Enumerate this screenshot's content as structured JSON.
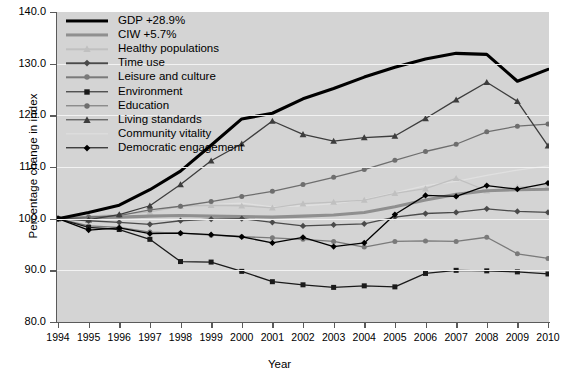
{
  "chart_data": {
    "type": "line",
    "title": "",
    "xlabel": "Year",
    "ylabel": "Percentage change in index",
    "x": [
      1994,
      1995,
      1996,
      1997,
      1998,
      1999,
      2000,
      2001,
      2002,
      2003,
      2004,
      2005,
      2006,
      2007,
      2008,
      2009,
      2010
    ],
    "xticklabels": [
      "1994",
      "1995",
      "1996",
      "1997",
      "1998",
      "1999",
      "2000",
      "2001",
      "2002",
      "2003",
      "2004",
      "2005",
      "2006",
      "2007",
      "2008",
      "2009",
      "2010"
    ],
    "ylim": [
      80.0,
      140.0
    ],
    "yticks": [
      80.0,
      90.0,
      100.0,
      110.0,
      120.0,
      130.0,
      140.0
    ],
    "yticklabels": [
      "80.0",
      "90.0",
      "100.0",
      "110.0",
      "120.0",
      "130.0",
      "140.0"
    ],
    "xlim": [
      1994,
      2010
    ],
    "grid": "horizontal",
    "legend_position": "upper-left",
    "plot_background": "#d4d4d4",
    "series": [
      {
        "name": "GDP +28.9%",
        "color": "#000000",
        "width": 3.1,
        "marker": "none",
        "values": [
          100.0,
          101.2,
          102.6,
          105.6,
          109.2,
          114.2,
          119.3,
          120.4,
          123.2,
          125.2,
          127.4,
          129.3,
          130.9,
          132.0,
          131.8,
          126.6,
          128.9
        ]
      },
      {
        "name": "CIW +5.7%",
        "color": "#8f8f8f",
        "width": 3.1,
        "marker": "none",
        "values": [
          100.0,
          100.2,
          100.3,
          100.5,
          100.6,
          100.5,
          100.4,
          100.3,
          100.5,
          100.7,
          101.2,
          102.3,
          103.6,
          104.7,
          105.4,
          105.6,
          105.7
        ]
      },
      {
        "name": "Healthy populations",
        "color": "#c0c0c0",
        "width": 1.3,
        "marker": "triangle",
        "values": [
          100.0,
          100.6,
          100.8,
          101.3,
          102.4,
          102.6,
          102.5,
          102.1,
          102.9,
          103.2,
          103.6,
          104.9,
          105.8,
          107.8,
          105.4,
          106.1,
          106.4
        ]
      },
      {
        "name": "Time use",
        "color": "#4a4a4a",
        "width": 1.3,
        "marker": "diamond",
        "values": [
          100.0,
          99.6,
          99.3,
          98.9,
          99.6,
          99.9,
          100.0,
          99.3,
          98.6,
          98.8,
          99.0,
          100.3,
          101.0,
          101.2,
          101.9,
          101.4,
          101.2
        ]
      },
      {
        "name": "Leisure and culture",
        "color": "#7a7a7a",
        "width": 1.3,
        "marker": "circle",
        "values": [
          100.0,
          98.6,
          98.3,
          97.4,
          97.2,
          96.8,
          96.5,
          96.3,
          96.0,
          95.6,
          94.5,
          95.6,
          95.7,
          95.6,
          96.4,
          93.2,
          92.3
        ]
      },
      {
        "name": "Environment",
        "color": "#1a1a1a",
        "width": 1.3,
        "marker": "square",
        "values": [
          100.0,
          98.3,
          97.9,
          96.0,
          91.7,
          91.6,
          89.8,
          87.8,
          87.2,
          86.7,
          87.0,
          86.8,
          89.4,
          90.0,
          89.9,
          89.7,
          89.3
        ]
      },
      {
        "name": "Education",
        "color": "#6e6e6e",
        "width": 1.3,
        "marker": "circle",
        "values": [
          100.0,
          100.3,
          100.6,
          101.7,
          102.4,
          103.3,
          104.3,
          105.3,
          106.6,
          108.0,
          109.5,
          111.3,
          113.0,
          114.4,
          116.8,
          117.9,
          118.3
        ]
      },
      {
        "name": "Living standards",
        "color": "#3d3d3d",
        "width": 1.3,
        "marker": "triangle",
        "values": [
          100.0,
          99.8,
          100.8,
          102.5,
          106.6,
          111.2,
          114.5,
          118.9,
          116.3,
          115.0,
          115.7,
          116.0,
          119.4,
          123.0,
          126.4,
          122.7,
          114.1
        ]
      },
      {
        "name": "Community vitality",
        "color": "#e0e0e0",
        "width": 1.3,
        "marker": "none",
        "values": [
          100.0,
          100.8,
          100.5,
          101.8,
          102.3,
          102.7,
          103.0,
          102.3,
          102.5,
          102.9,
          103.7,
          105.0,
          106.4,
          107.2,
          108.4,
          109.4,
          110.2
        ]
      },
      {
        "name": "Democratic engagement",
        "color": "#000000",
        "width": 1.3,
        "marker": "diamond",
        "values": [
          100.0,
          97.8,
          98.2,
          97.1,
          97.2,
          96.9,
          96.5,
          95.3,
          96.4,
          94.6,
          95.3,
          100.8,
          104.5,
          104.3,
          106.4,
          105.7,
          106.9
        ]
      }
    ]
  }
}
